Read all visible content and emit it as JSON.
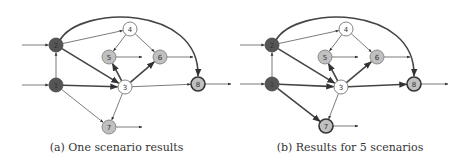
{
  "panels": [
    {
      "id": "a",
      "caption": "(a) One scenario results",
      "nodes": [
        {
          "id": "1",
          "label": "1",
          "x": 56,
          "y": 85,
          "fill": "#555555",
          "stroke": "#444444",
          "thick": false,
          "text": "#333333"
        },
        {
          "id": "2",
          "label": "2",
          "x": 56,
          "y": 45,
          "fill": "#555555",
          "stroke": "#444444",
          "thick": false,
          "text": "#333333"
        },
        {
          "id": "3",
          "label": "3",
          "x": 125,
          "y": 87,
          "fill": "#ffffff",
          "stroke": "#666666",
          "thick": false,
          "text": "#333333"
        },
        {
          "id": "4",
          "label": "4",
          "x": 130,
          "y": 29,
          "fill": "#ffffff",
          "stroke": "#666666",
          "thick": false,
          "text": "#333333"
        },
        {
          "id": "5",
          "label": "5",
          "x": 109,
          "y": 57,
          "fill": "#c0c0c0",
          "stroke": "#777777",
          "thick": false,
          "text": "#333333"
        },
        {
          "id": "6",
          "label": "6",
          "x": 160,
          "y": 57,
          "fill": "#c0c0c0",
          "stroke": "#777777",
          "thick": false,
          "text": "#333333"
        },
        {
          "id": "7",
          "label": "7",
          "x": 109,
          "y": 127,
          "fill": "#c0c0c0",
          "stroke": "#777777",
          "thick": false,
          "text": "#333333"
        },
        {
          "id": "8",
          "label": "8",
          "x": 198,
          "y": 84,
          "fill": "#c0c0c0",
          "stroke": "#333333",
          "thick": true,
          "text": "#333333"
        }
      ],
      "edges": [
        {
          "from": "1",
          "to": "2",
          "thick": false
        },
        {
          "from": "2",
          "to": "4",
          "thick": false
        },
        {
          "from": "2",
          "to": "3",
          "thick": true
        },
        {
          "from": "1",
          "to": "3",
          "thick": true
        },
        {
          "from": "1",
          "to": "7",
          "thick": false
        },
        {
          "from": "4",
          "to": "5",
          "thick": false
        },
        {
          "from": "4",
          "to": "6",
          "thick": false
        },
        {
          "from": "3",
          "to": "5",
          "thick": true
        },
        {
          "from": "3",
          "to": "6",
          "thick": true
        },
        {
          "from": "3",
          "to": "7",
          "thick": false
        },
        {
          "from": "3",
          "to": "8",
          "thick": false
        }
      ],
      "curve": {
        "from": "2",
        "to": "8",
        "thick": true
      },
      "inputs": [
        {
          "node": "2",
          "x1": 22
        },
        {
          "node": "1",
          "x1": 22
        }
      ],
      "outputs": [
        {
          "node": "5",
          "x2": 142
        },
        {
          "node": "6",
          "x2": 193
        },
        {
          "node": "7",
          "x2": 142
        },
        {
          "node": "8",
          "x2": 231
        }
      ]
    },
    {
      "id": "b",
      "caption": "(b) Results for 5 scenarios",
      "nodes": [
        {
          "id": "1",
          "label": "1",
          "x": 272,
          "y": 84,
          "fill": "#555555",
          "stroke": "#444444",
          "thick": false,
          "text": "#333333"
        },
        {
          "id": "2",
          "label": "2",
          "x": 272,
          "y": 45,
          "fill": "#555555",
          "stroke": "#444444",
          "thick": false,
          "text": "#333333"
        },
        {
          "id": "3",
          "label": "3",
          "x": 341,
          "y": 87,
          "fill": "#ffffff",
          "stroke": "#666666",
          "thick": false,
          "text": "#333333"
        },
        {
          "id": "4",
          "label": "4",
          "x": 346,
          "y": 29,
          "fill": "#ffffff",
          "stroke": "#666666",
          "thick": false,
          "text": "#333333"
        },
        {
          "id": "5",
          "label": "5",
          "x": 325,
          "y": 57,
          "fill": "#c0c0c0",
          "stroke": "#777777",
          "thick": false,
          "text": "#333333"
        },
        {
          "id": "6",
          "label": "6",
          "x": 377,
          "y": 57,
          "fill": "#c0c0c0",
          "stroke": "#777777",
          "thick": false,
          "text": "#333333"
        },
        {
          "id": "7",
          "label": "7",
          "x": 326,
          "y": 126,
          "fill": "#c0c0c0",
          "stroke": "#333333",
          "thick": true,
          "text": "#333333"
        },
        {
          "id": "8",
          "label": "8",
          "x": 414,
          "y": 84,
          "fill": "#c0c0c0",
          "stroke": "#333333",
          "thick": true,
          "text": "#333333"
        }
      ],
      "edges": [
        {
          "from": "1",
          "to": "2",
          "thick": false
        },
        {
          "from": "2",
          "to": "4",
          "thick": false
        },
        {
          "from": "2",
          "to": "3",
          "thick": true
        },
        {
          "from": "1",
          "to": "3",
          "thick": true
        },
        {
          "from": "1",
          "to": "7",
          "thick": true
        },
        {
          "from": "4",
          "to": "5",
          "thick": false
        },
        {
          "from": "4",
          "to": "6",
          "thick": false
        },
        {
          "from": "3",
          "to": "5",
          "thick": true
        },
        {
          "from": "3",
          "to": "6",
          "thick": true
        },
        {
          "from": "3",
          "to": "7",
          "thick": false
        },
        {
          "from": "3",
          "to": "8",
          "thick": true
        }
      ],
      "curve": {
        "from": "2",
        "to": "8",
        "thick": true
      },
      "inputs": [
        {
          "node": "2",
          "x1": 240
        },
        {
          "node": "1",
          "x1": 240
        }
      ],
      "outputs": [
        {
          "node": "5",
          "x2": 358
        },
        {
          "node": "6",
          "x2": 410
        },
        {
          "node": "7",
          "x2": 358
        },
        {
          "node": "8",
          "x2": 448
        }
      ]
    }
  ],
  "style": {
    "radius": 7,
    "edge_color": "#444444",
    "thin_width": 0.7,
    "thick_width": 1.6
  }
}
